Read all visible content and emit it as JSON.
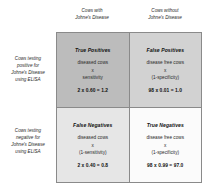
{
  "columns": {
    "with_disease": "Cows with\nJohne's Disease",
    "without_disease": "Cows without\nJohne's Disease"
  },
  "rows": {
    "positive": "Cows testing\npositive for\nJohne's Disease\nusing ELISA",
    "negative": "Cows testing\nnegative for\nJohne's Disease\nusing ELISA"
  },
  "cells": {
    "true_positives": {
      "title": "True Positives",
      "formula": "diseased cows\nx\nsensitivity",
      "result": "2 x 0.60 = 1.2"
    },
    "false_positives": {
      "title": "False Positives",
      "formula": "disease free cows\nx\n(1-specificity)",
      "result": "98 x 0.01 = 1.0"
    },
    "false_negatives": {
      "title": "False Negatives",
      "formula": "diseased cows\nx\n(1-sensitivity)",
      "result": "2 x 0.40 = 0.8"
    },
    "true_negatives": {
      "title": "True Negatives",
      "formula": "disease free cows\nx\n(1-specificity)",
      "result": "98 x 0.99 = 97.0"
    }
  },
  "colors": {
    "true_positives_bg": "#bcbcbc",
    "false_positives_bg": "#d2d2d2",
    "false_negatives_bg": "#e6e6e6",
    "true_negatives_bg": "#fbfbfb",
    "border": "#8a8a8a"
  }
}
